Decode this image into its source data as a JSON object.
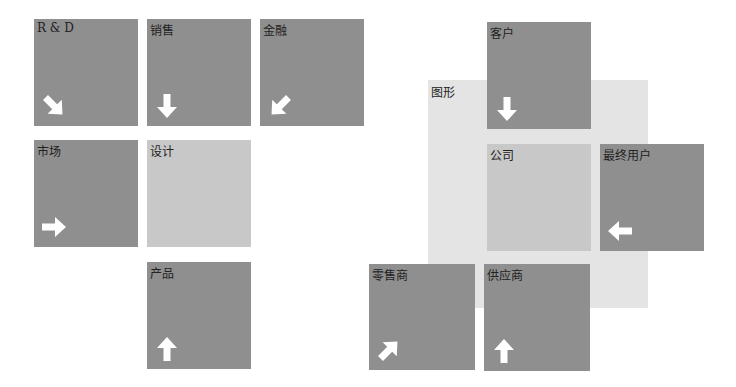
{
  "left_diagram": {
    "boxes": [
      {
        "label": "R & D",
        "arrow": "down-right"
      },
      {
        "label": "销售",
        "arrow": "down"
      },
      {
        "label": "金融",
        "arrow": "down-left"
      },
      {
        "label": "市场",
        "arrow": "right"
      },
      {
        "label": "设计",
        "arrow": "none"
      },
      {
        "label": "产品",
        "arrow": "up"
      }
    ]
  },
  "right_diagram": {
    "panel_label": "图形",
    "boxes": [
      {
        "label": "客户",
        "arrow": "down"
      },
      {
        "label": "公司",
        "arrow": "none"
      },
      {
        "label": "最终用户",
        "arrow": "left"
      },
      {
        "label": "零售商",
        "arrow": "up-right"
      },
      {
        "label": "供应商",
        "arrow": "up"
      }
    ]
  },
  "colors": {
    "dark_box": "#8f8f8f",
    "light_box": "#c8c8c8",
    "panel": "#e4e4e4",
    "arrow": "#ffffff"
  }
}
